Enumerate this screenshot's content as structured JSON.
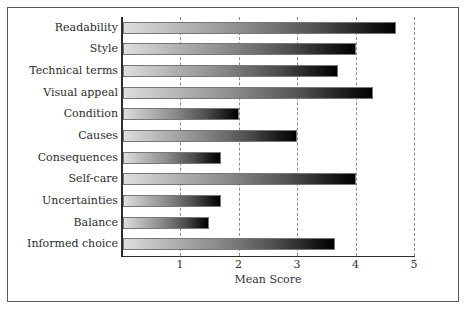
{
  "chart_data": {
    "type": "bar",
    "orientation": "horizontal",
    "title": "",
    "xlabel": "Mean Score",
    "ylabel": "",
    "xlim": [
      0,
      5.3
    ],
    "xticks": [
      1,
      2,
      3,
      4,
      5
    ],
    "xtick_labels": [
      "1",
      "2",
      "3",
      "4",
      "5"
    ],
    "grid": true,
    "grid_axis": "x",
    "grid_style": "dashed",
    "legend": false,
    "bar_style": "horizontal gradient light-gray to black",
    "categories": [
      "Readability",
      "Style",
      "Technical terms",
      "Visual appeal",
      "Condition",
      "Causes",
      "Consequences",
      "Self-care",
      "Uncertainties",
      "Balance",
      "Informed choice"
    ],
    "values": [
      4.7,
      4.0,
      3.7,
      4.3,
      2.0,
      3.0,
      1.7,
      4.0,
      1.7,
      1.5,
      3.65
    ]
  },
  "colors": {
    "frame": "#5a5a5a",
    "axis": "#2e2e2e",
    "gridline": "#8d8d8d",
    "bar_start": "#dedede",
    "bar_end": "#000000",
    "text": "#2b2b2b",
    "background": "#ffffff"
  }
}
